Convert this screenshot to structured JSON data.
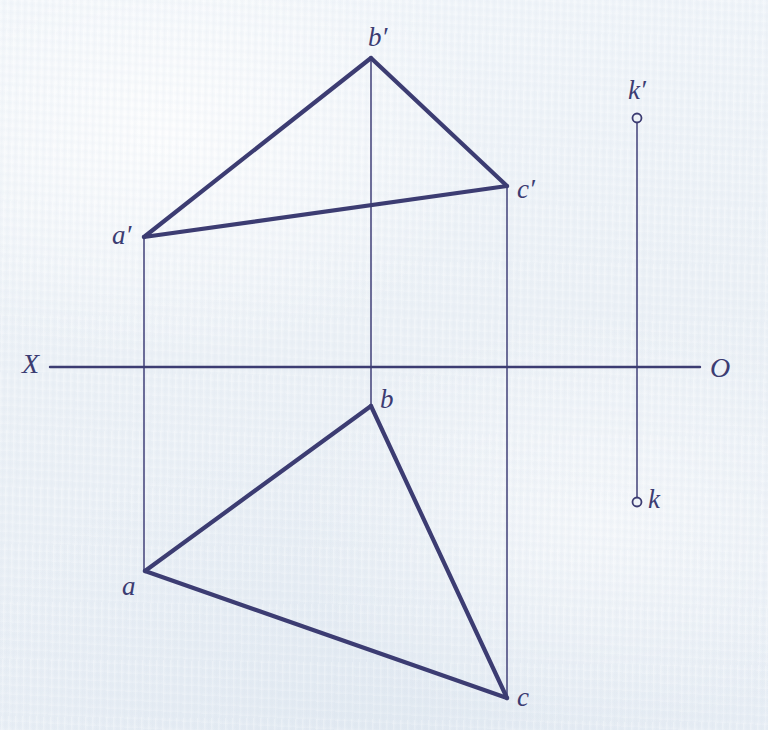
{
  "drawing": {
    "title": "Two-view orthographic projection of triangle ABC with point K",
    "background_color": "#eef3f8",
    "ink_color": "#3c3c72",
    "thin_ink_color": "#4b4b80",
    "axis": {
      "name": "ground-line",
      "label_left": "X",
      "label_right": "O",
      "y": 367,
      "x_start": 50,
      "x_end": 700
    },
    "points": [
      {
        "id": "a_prime",
        "label": "a′",
        "x": 144,
        "y": 237,
        "label_x": 112,
        "label_y": 222,
        "view": "frontal"
      },
      {
        "id": "b_prime",
        "label": "b′",
        "x": 371,
        "y": 58,
        "label_x": 368,
        "label_y": 24,
        "view": "frontal"
      },
      {
        "id": "c_prime",
        "label": "c′",
        "x": 507,
        "y": 186,
        "label_x": 517,
        "label_y": 176,
        "view": "frontal"
      },
      {
        "id": "a",
        "label": "a",
        "x": 145,
        "y": 571,
        "label_x": 122,
        "label_y": 573,
        "view": "horizontal"
      },
      {
        "id": "b",
        "label": "b",
        "x": 371,
        "y": 406,
        "label_x": 380,
        "label_y": 386,
        "view": "horizontal"
      },
      {
        "id": "c",
        "label": "c",
        "x": 507,
        "y": 698,
        "label_x": 517,
        "label_y": 684,
        "view": "horizontal"
      },
      {
        "id": "k_prime",
        "label": "k′",
        "x": 637,
        "y": 118,
        "label_x": 628,
        "label_y": 77,
        "view": "frontal"
      },
      {
        "id": "k",
        "label": "k",
        "x": 637,
        "y": 502,
        "label_x": 648,
        "label_y": 486,
        "view": "horizontal"
      }
    ],
    "thick_edges": [
      {
        "name": "edge-a-prime-b-prime",
        "x1": 144,
        "y1": 237,
        "x2": 371,
        "y2": 58
      },
      {
        "name": "edge-b-prime-c-prime",
        "x1": 371,
        "y1": 58,
        "x2": 507,
        "y2": 186
      },
      {
        "name": "edge-a-prime-c-prime",
        "x1": 144,
        "y1": 237,
        "x2": 507,
        "y2": 186
      },
      {
        "name": "edge-a-b",
        "x1": 145,
        "y1": 571,
        "x2": 371,
        "y2": 406
      },
      {
        "name": "edge-b-c",
        "x1": 371,
        "y1": 406,
        "x2": 507,
        "y2": 698
      },
      {
        "name": "edge-a-c",
        "x1": 145,
        "y1": 571,
        "x2": 507,
        "y2": 698
      }
    ],
    "projection_lines": [
      {
        "name": "projector-a",
        "x1": 144,
        "y1": 237,
        "x2": 144,
        "y2": 571
      },
      {
        "name": "projector-b",
        "x1": 371,
        "y1": 58,
        "x2": 371,
        "y2": 407
      },
      {
        "name": "projector-c",
        "x1": 507,
        "y1": 186,
        "x2": 507,
        "y2": 698
      },
      {
        "name": "projector-k",
        "x1": 637,
        "y1": 120,
        "x2": 637,
        "y2": 500
      }
    ],
    "markers": [
      {
        "name": "point-marker-k-prime",
        "x": 637,
        "y": 118,
        "r": 4.5
      },
      {
        "name": "point-marker-k",
        "x": 637,
        "y": 502,
        "r": 4.5
      }
    ],
    "stroke_widths": {
      "thick": 4.2,
      "thin": 1.6,
      "axis": 2.4
    }
  }
}
